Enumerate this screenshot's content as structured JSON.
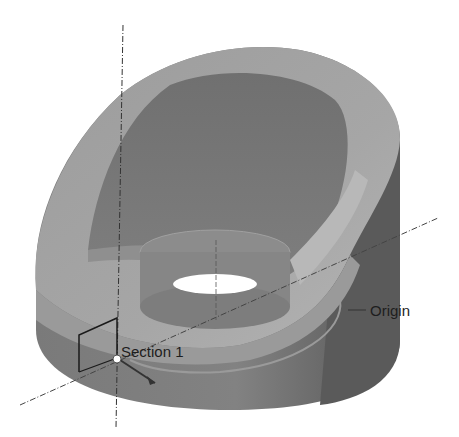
{
  "diagram": {
    "type": "3d-cad-model",
    "labels": {
      "section": "Section 1",
      "origin": "Origin"
    },
    "colors": {
      "background": "#ffffff",
      "outer_wall": "#7c7c7c",
      "outer_wall_dark": "#5e5e5e",
      "top_band": "#a3a3a3",
      "inner_bowl": "#6e6e6e",
      "inner_cylinder": "#8a8a8a",
      "axis_line": "#3a3a3a",
      "hole": "#ffffff"
    }
  }
}
